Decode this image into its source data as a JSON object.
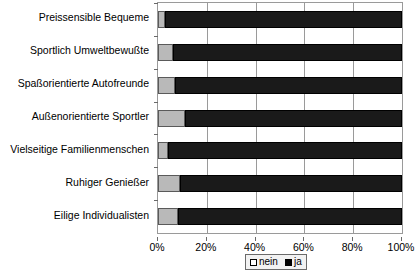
{
  "chart_data": {
    "type": "bar",
    "orientation": "horizontal",
    "stacked": true,
    "normalized_percent": true,
    "title": "",
    "subtitle": "",
    "xlabel": "",
    "ylabel": "",
    "xlim": [
      0,
      100
    ],
    "xticks": [
      "0%",
      "20%",
      "40%",
      "60%",
      "80%",
      "100%"
    ],
    "xtick_values": [
      0,
      20,
      40,
      60,
      80,
      100
    ],
    "grid": true,
    "grid_axis": "x",
    "legend_position": "bottom",
    "categories": [
      "Preissensible Bequeme",
      "Sportlich Umweltbewußte",
      "Spaßorientierte Autofreunde",
      "Außenorientierte Sportler",
      "Vielseitige Familienmenschen",
      "Ruhiger Genießer",
      "Eilige Individualisten"
    ],
    "series": [
      {
        "name": "nein",
        "color": "#b9b9b9",
        "values": [
          3,
          6,
          7,
          11,
          4,
          9,
          8
        ]
      },
      {
        "name": "ja",
        "color": "#000000",
        "values": [
          97,
          94,
          93,
          89,
          96,
          91,
          92
        ]
      }
    ]
  },
  "legend": {
    "entries": [
      {
        "label": "nein"
      },
      {
        "label": "ja"
      }
    ]
  }
}
